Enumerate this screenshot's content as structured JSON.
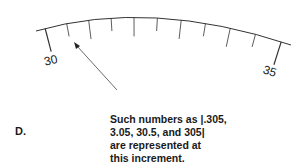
{
  "figure": {
    "panel_label": "D.",
    "scale": {
      "start_value": 30,
      "end_value": 35,
      "major_labels": [
        "30",
        "35"
      ],
      "minor_divisions": 10,
      "highlighted_increment_value": 30.5
    },
    "caption_lines": [
      "Such numbers as |.305,",
      "3.05, 30.5, and 305|",
      "are represented at",
      "this increment."
    ]
  }
}
